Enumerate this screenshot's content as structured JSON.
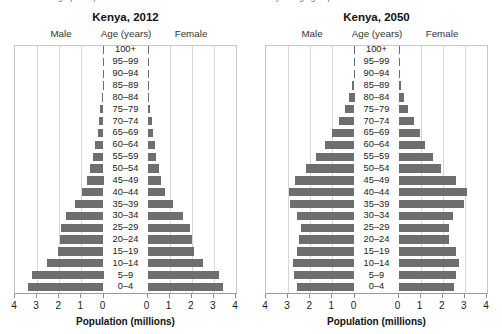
{
  "caption": {
    "text": "2050. The graphs represent the number of males and females in five-year age groups."
  },
  "axis": {
    "title": "Population (millions)",
    "tick_labels": [
      "4",
      "3",
      "2",
      "1",
      "0",
      "0",
      "1",
      "2",
      "3",
      "4"
    ],
    "max": 4
  },
  "headers": {
    "male": "Male",
    "age": "Age (years)",
    "female": "Female"
  },
  "colors": {
    "bar": "#6e6e6e",
    "grid": "#d6d6d6",
    "axis": "#9a9a9a",
    "background": "#ffffff"
  },
  "panels": [
    {
      "id": "kenya-2012",
      "title": "Kenya, 2012"
    },
    {
      "id": "kenya-2050",
      "title": "Kenya, 2050"
    }
  ],
  "chart_data": [
    {
      "type": "bar",
      "subtype": "population-pyramid",
      "title": "Kenya, 2012",
      "xlabel": "Population (millions)",
      "ylabel": "Age (years)",
      "xlim": [
        0,
        4
      ],
      "grid": true,
      "legend_position": "top",
      "categories": [
        "0–4",
        "5–9",
        "10–14",
        "15–19",
        "20–24",
        "25–29",
        "30–34",
        "35–39",
        "40–44",
        "45–49",
        "50–54",
        "55–59",
        "60–64",
        "65–69",
        "70–74",
        "75–79",
        "80–84",
        "85–89",
        "90–94",
        "95–99",
        "100+"
      ],
      "series": [
        {
          "name": "Male",
          "values": [
            3.4,
            3.25,
            2.55,
            2.05,
            1.95,
            1.9,
            1.7,
            1.3,
            0.95,
            0.75,
            0.6,
            0.47,
            0.37,
            0.27,
            0.2,
            0.14,
            0.08,
            0.04,
            0.015,
            0.004,
            0.001
          ]
        },
        {
          "name": "Female",
          "values": [
            3.4,
            3.25,
            2.5,
            2.1,
            2.0,
            1.9,
            1.6,
            1.15,
            0.8,
            0.62,
            0.5,
            0.4,
            0.32,
            0.25,
            0.19,
            0.13,
            0.08,
            0.04,
            0.015,
            0.004,
            0.001
          ]
        }
      ]
    },
    {
      "type": "bar",
      "subtype": "population-pyramid",
      "title": "Kenya, 2050",
      "xlabel": "Population (millions)",
      "ylabel": "Age (years)",
      "xlim": [
        0,
        4
      ],
      "grid": true,
      "legend_position": "top",
      "categories": [
        "0–4",
        "5–9",
        "10–14",
        "15–19",
        "20–24",
        "25–29",
        "30–34",
        "35–39",
        "40–44",
        "45–49",
        "50–54",
        "55–59",
        "60–64",
        "65–69",
        "70–74",
        "75–79",
        "80–84",
        "85–89",
        "90–94",
        "95–99",
        "100+"
      ],
      "series": [
        {
          "name": "Male",
          "values": [
            2.62,
            2.72,
            2.8,
            2.62,
            2.52,
            2.42,
            2.6,
            2.92,
            2.95,
            2.68,
            2.18,
            1.72,
            1.35,
            1.02,
            0.7,
            0.45,
            0.25,
            0.11,
            0.035,
            0.008,
            0.002
          ]
        },
        {
          "name": "Female",
          "values": [
            2.52,
            2.62,
            2.72,
            2.58,
            2.3,
            2.28,
            2.48,
            2.98,
            3.08,
            2.58,
            1.92,
            1.58,
            1.22,
            0.95,
            0.68,
            0.45,
            0.26,
            0.13,
            0.045,
            0.01,
            0.002
          ]
        }
      ]
    }
  ]
}
